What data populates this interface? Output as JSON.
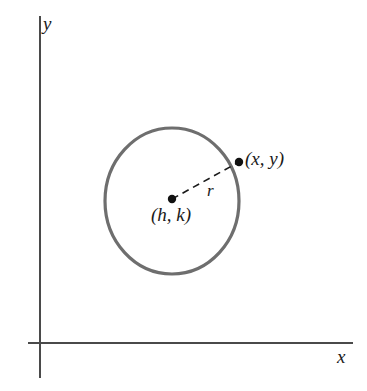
{
  "figure": {
    "type": "geometry-diagram",
    "background_color": "#ffffff"
  },
  "axes": {
    "x_label": "x",
    "y_label": "y",
    "axis_color": "#4a4a4a",
    "origin": {
      "x": 40,
      "y": 343
    },
    "x_axis": {
      "start_x": 28,
      "end_x": 353,
      "y": 343
    },
    "y_axis": {
      "x": 40,
      "start_y": 16,
      "end_y": 378
    }
  },
  "circle": {
    "center": {
      "x": 172,
      "y": 201
    },
    "radius_x": 67,
    "radius_y": 73,
    "stroke_color": "#6e6e6e",
    "stroke_width": 3.2,
    "fill": "none"
  },
  "points": [
    {
      "id": "center-point",
      "label": "(h, k)",
      "x": 172,
      "y": 199,
      "dot_radius": 4.2,
      "color": "#111111",
      "label_x": 151,
      "label_y": 205
    },
    {
      "id": "circle-point",
      "label": "(x, y)",
      "x": 239,
      "y": 162,
      "dot_radius": 4.2,
      "color": "#111111",
      "label_x": 245,
      "label_y": 149
    }
  ],
  "radius_segment": {
    "label": "r",
    "from": {
      "x": 172,
      "y": 199
    },
    "to": {
      "x": 239,
      "y": 162
    },
    "dash_pattern": "7 5",
    "stroke_color": "#1a1a1a",
    "stroke_width": 1.6,
    "label_x": 207,
    "label_y": 182
  }
}
